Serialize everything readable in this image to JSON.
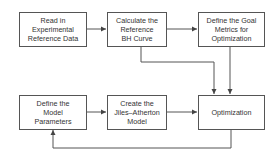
{
  "diagram": {
    "type": "flowchart",
    "colors": {
      "line": "#555555",
      "text": "#333333",
      "background": "#ffffff"
    },
    "nodes": [
      {
        "id": "read_data",
        "label": "Read in\nExperimental\nReference Data"
      },
      {
        "id": "calc_bh",
        "label": "Calculate the\nReference\nBH Curve"
      },
      {
        "id": "goal_metrics",
        "label": "Define the Goal\nMetrics for\nOptimization"
      },
      {
        "id": "model_params",
        "label": "Define the\nModel\nParameters"
      },
      {
        "id": "ja_model",
        "label": "Create the\nJiles–Atherton\nModel"
      },
      {
        "id": "optimization",
        "label": "Optimization"
      }
    ],
    "edges": [
      {
        "from": "read_data",
        "to": "calc_bh"
      },
      {
        "from": "calc_bh",
        "to": "goal_metrics"
      },
      {
        "from": "calc_bh",
        "to": "optimization"
      },
      {
        "from": "goal_metrics",
        "to": "optimization"
      },
      {
        "from": "model_params",
        "to": "ja_model"
      },
      {
        "from": "ja_model",
        "to": "optimization"
      },
      {
        "from": "optimization",
        "to": "model_params"
      }
    ]
  }
}
